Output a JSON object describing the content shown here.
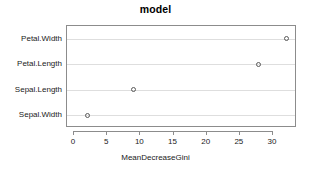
{
  "chart_data": {
    "type": "scatter",
    "title": "model",
    "xlabel": "MeanDecreaseGini",
    "ylabel": "",
    "categories": [
      "Sepal.Width",
      "Sepal.Length",
      "Petal.Length",
      "Petal.Width"
    ],
    "values": [
      2.0,
      9.0,
      27.8,
      32.1
    ],
    "series": [
      {
        "name": "MeanDecreaseGini",
        "points": [
          {
            "label": "Petal.Width",
            "value": 32.1
          },
          {
            "label": "Petal.Length",
            "value": 27.8
          },
          {
            "label": "Sepal.Length",
            "value": 9.0
          },
          {
            "label": "Sepal.Width",
            "value": 2.0
          }
        ]
      }
    ],
    "xticks": [
      0,
      5,
      10,
      15,
      20,
      25,
      30
    ],
    "xticklabels": [
      "0",
      "5",
      "10",
      "15",
      "20",
      "25",
      "30"
    ],
    "xlim": [
      0,
      33.6
    ],
    "grid": true,
    "grid_orientation": "horizontal",
    "legend": null,
    "marker": "open-circle",
    "colors": {
      "marker": "#5a5a5a",
      "grid": "#dedede",
      "axis": "#8c8c8c",
      "text": "#1a1a1a",
      "background": "#ffffff"
    }
  },
  "axis_labels": {
    "y": [
      "Petal.Width",
      "Petal.Length",
      "Sepal.Length",
      "Sepal.Width"
    ],
    "x": [
      "0",
      "5",
      "10",
      "15",
      "20",
      "25",
      "30"
    ]
  }
}
